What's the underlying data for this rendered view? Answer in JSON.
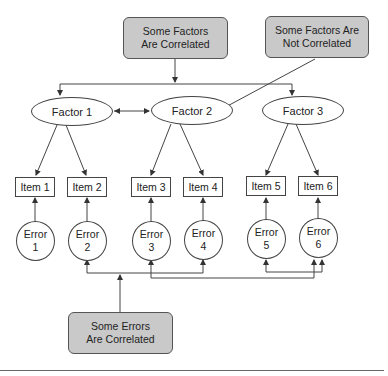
{
  "notes": {
    "factors_correlated": [
      "Some Factors",
      "Are Correlated"
    ],
    "factors_not_correlated": [
      "Some Factors Are",
      "Not Correlated"
    ],
    "errors_correlated": [
      "Some Errors",
      "Are Correlated"
    ]
  },
  "factors": [
    {
      "label": "Factor 1"
    },
    {
      "label": "Factor 2"
    },
    {
      "label": "Factor 3"
    }
  ],
  "items": [
    {
      "label": "Item 1"
    },
    {
      "label": "Item 2"
    },
    {
      "label": "Item 3"
    },
    {
      "label": "Item 4"
    },
    {
      "label": "Item 5"
    },
    {
      "label": "Item 6"
    }
  ],
  "errors": [
    {
      "word": "Error",
      "num": "1"
    },
    {
      "word": "Error",
      "num": "2"
    },
    {
      "word": "Error",
      "num": "3"
    },
    {
      "word": "Error",
      "num": "4"
    },
    {
      "word": "Error",
      "num": "5"
    },
    {
      "word": "Error",
      "num": "6"
    }
  ],
  "colors": {
    "note_fill": "#c9c9c9",
    "line": "#444444"
  }
}
